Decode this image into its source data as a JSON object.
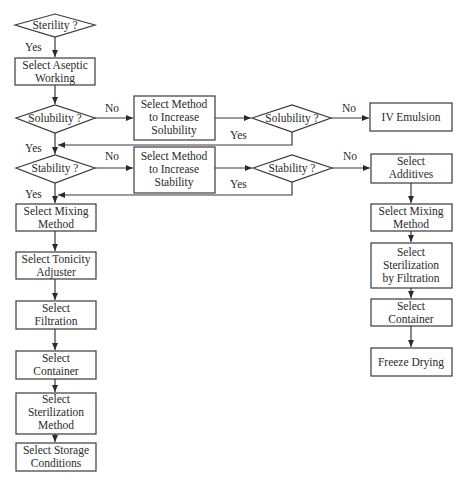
{
  "diagram": {
    "type": "flowchart",
    "nodes": {
      "sterility": "Sterility ?",
      "aseptic": [
        "Select Aseptic",
        "Working"
      ],
      "solubility1": "Solubility ?",
      "increase_solubility": [
        "Select Method",
        "to Increase",
        "Solubility"
      ],
      "solubility2": "Solubility ?",
      "iv_emulsion": "IV Emulsion",
      "stability1": "Stability ?",
      "increase_stability": [
        "Select Method",
        "to Increase",
        "Stability"
      ],
      "stability2": "Stability ?",
      "additives": [
        "Select",
        "Additives"
      ],
      "mixing_left": [
        "Select Mixing",
        "Method"
      ],
      "tonicity": [
        "Select Tonicity",
        "Adjuster"
      ],
      "filtration": [
        "Select",
        "Filtration"
      ],
      "container_left": [
        "Select",
        "Container"
      ],
      "sterilization_method": [
        "Select",
        "Sterilization",
        "Method"
      ],
      "storage": [
        "Select Storage",
        "Conditions"
      ],
      "mixing_right": [
        "Select Mixing",
        "Method"
      ],
      "sterilization_filtration": [
        "Select",
        "Sterilization",
        "by Filtration"
      ],
      "container_right": [
        "Select",
        "Container"
      ],
      "freeze_drying": "Freeze Drying"
    },
    "edge_labels": {
      "sterility_yes": "Yes",
      "solubility1_no": "No",
      "solubility1_yes": "Yes",
      "solubility2_no": "No",
      "solubility2_yes": "Yes",
      "stability1_no": "No",
      "stability1_yes": "Yes",
      "stability2_no": "No",
      "stability2_yes": "Yes"
    }
  }
}
